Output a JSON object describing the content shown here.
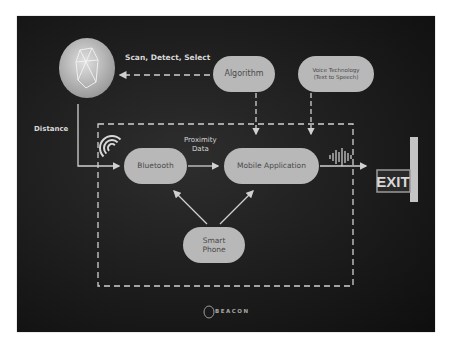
{
  "diagram": {
    "nodes": {
      "algorithm": "Algorithm",
      "voice_line1": "Voice Technology",
      "voice_line2": "(Text to Speech)",
      "bluetooth": "Bluetooth",
      "mobile_app": "Mobile Application",
      "smart_line1": "Smart",
      "smart_line2": "Phone"
    },
    "labels": {
      "scan": "Scan, Detect, Select",
      "distance": "Distance",
      "proximity_line1": "Proximity",
      "proximity_line2": "Data",
      "exit": "EXIT"
    },
    "logo": "BEACON",
    "colors": {
      "background": "#1c1c1c",
      "node_fill": "#b8b8b8",
      "node_text": "#4a4a4a",
      "line": "#d0d0d0"
    }
  }
}
